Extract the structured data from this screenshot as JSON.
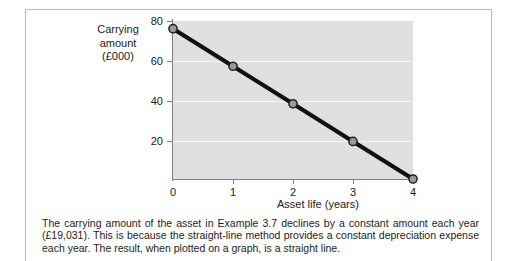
{
  "figure": {
    "caption": "The carrying amount of the asset in Example 3.7 declines by a constant amount each year (£19,031). This is because the straight-line method provides a constant depreciation expense each year. The result, when plotted on a graph, is a straight line."
  },
  "chart_data": {
    "type": "line",
    "title": "",
    "xlabel": "Asset life (years)",
    "ylabel": "Carrying amount (£000)",
    "ylabel_lines": [
      "Carrying",
      "amount",
      "(£000)"
    ],
    "x": [
      0,
      1,
      2,
      3,
      4
    ],
    "values": [
      76.1,
      57.1,
      38.1,
      19.0,
      0.0
    ],
    "series": [
      {
        "name": "Carrying amount",
        "values": [
          76.1,
          57.1,
          38.1,
          19.0,
          0.0
        ]
      }
    ],
    "xtick_labels": [
      "0",
      "1",
      "2",
      "3",
      "4"
    ],
    "ytick_labels": [
      "80",
      "60",
      "40",
      "20"
    ],
    "xlim": [
      0,
      4
    ],
    "ylim": [
      0,
      80
    ],
    "grid": "horizontal",
    "legend": "none",
    "annual_decline": "£19,031",
    "colors": {
      "plot_background": "#e0e0e0",
      "gridline": "#f4f4f4",
      "line": "#111111",
      "marker_fill": "#9a9a9a",
      "marker_stroke": "#222222",
      "axis": "#808080",
      "text": "#1a1a1a",
      "border": "#b9b9b9"
    }
  }
}
